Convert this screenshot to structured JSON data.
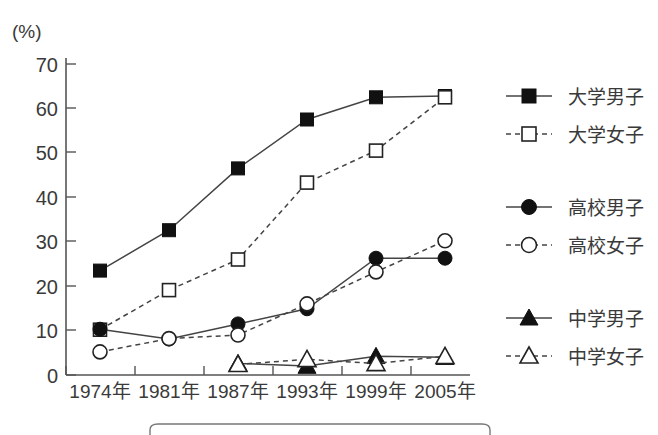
{
  "chart_data": {
    "type": "line",
    "title": "",
    "subtitle": "",
    "xlabel": "",
    "ylabel": "",
    "unit_label": "(%)",
    "categories": [
      "1974年",
      "1981年",
      "1987年",
      "1993年",
      "1999年",
      "2005年"
    ],
    "ylim": [
      0,
      70
    ],
    "ytick_labels": [
      "0",
      "10",
      "20",
      "30",
      "40",
      "50",
      "60",
      "70"
    ],
    "ytick_values": [
      0,
      10,
      20,
      30,
      40,
      50,
      60,
      70
    ],
    "grid": false,
    "legend_position": "right",
    "series": [
      {
        "name": "大学男子",
        "marker": "filled-square",
        "linestyle": "solid",
        "color": "#111111",
        "values": [
          23.5,
          32.6,
          46.5,
          57.5,
          62.5,
          62.8
        ]
      },
      {
        "name": "大学女子",
        "marker": "open-square",
        "linestyle": "dashed",
        "color": "#111111",
        "values": [
          10.2,
          19.1,
          26.0,
          43.3,
          50.5,
          62.5
        ]
      },
      {
        "name": "高校男子",
        "marker": "filled-circle",
        "linestyle": "solid",
        "color": "#111111",
        "values": [
          10.3,
          8.1,
          11.5,
          14.9,
          26.3,
          26.3
        ]
      },
      {
        "name": "高校女子",
        "marker": "open-circle",
        "linestyle": "dashed",
        "color": "#111111",
        "values": [
          5.2,
          8.2,
          9.0,
          16.0,
          23.2,
          30.2
        ]
      },
      {
        "name": "中学男子",
        "marker": "filled-triangle",
        "linestyle": "solid",
        "color": "#111111",
        "values": [
          null,
          null,
          2.6,
          2.0,
          4.2,
          4.0
        ]
      },
      {
        "name": "中学女子",
        "marker": "open-triangle",
        "linestyle": "dashed",
        "color": "#111111",
        "values": [
          null,
          null,
          2.4,
          3.5,
          2.6,
          4.2
        ]
      }
    ]
  },
  "legend": {
    "entries": [
      {
        "label": "大学男子"
      },
      {
        "label": "大学女子"
      },
      {
        "label": "高校男子"
      },
      {
        "label": "高校女子"
      },
      {
        "label": "中学男子"
      },
      {
        "label": "中学女子"
      }
    ]
  },
  "axes": {
    "unit": "(%)",
    "y_ticks": [
      "70",
      "60",
      "50",
      "40",
      "30",
      "20",
      "10",
      "0"
    ],
    "x_ticks": [
      "1974年",
      "1981年",
      "1987年",
      "1993年",
      "1999年",
      "2005年"
    ]
  }
}
